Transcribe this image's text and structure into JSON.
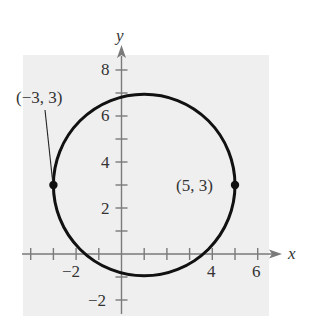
{
  "figure": {
    "type": "circle-graph",
    "equation_center": [
      1,
      3
    ],
    "radius": 4,
    "axes": {
      "x_label": "x",
      "y_label": "y",
      "x_tick_labels": [
        {
          "value": -2,
          "text": "−2"
        },
        {
          "value": 4,
          "text": "4"
        },
        {
          "value": 6,
          "text": "6"
        }
      ],
      "y_tick_labels": [
        {
          "value": 8,
          "text": "8"
        },
        {
          "value": 6,
          "text": "6"
        },
        {
          "value": 4,
          "text": "4"
        },
        {
          "value": 2,
          "text": "2"
        },
        {
          "value": -2,
          "text": "−2"
        }
      ],
      "x_ticks": [
        -4,
        -3,
        -2,
        -1,
        1,
        2,
        3,
        4,
        5,
        6
      ],
      "y_ticks": [
        -2,
        -1,
        1,
        2,
        3,
        4,
        5,
        6,
        7,
        8
      ]
    },
    "points": [
      {
        "x": -3,
        "y": 3,
        "label": "(−3, 3)"
      },
      {
        "x": 5,
        "y": 3,
        "label": "(5, 3)"
      }
    ],
    "colors": {
      "background_panel": "#efefef",
      "axis": "#7a7a7a",
      "curve": "#111111"
    }
  }
}
